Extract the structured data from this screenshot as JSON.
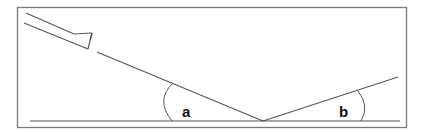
{
  "diagram": {
    "title": "",
    "labels": {
      "angle_a": "a",
      "angle_b": "b"
    },
    "colors": {
      "stroke": "#555555",
      "frame": "#777777",
      "text": "#111111",
      "background": "#ffffff"
    },
    "elements": [
      "frame",
      "mirror",
      "incident-ray",
      "reflected-ray",
      "ground-line",
      "angle-arc-a",
      "angle-arc-b"
    ]
  }
}
